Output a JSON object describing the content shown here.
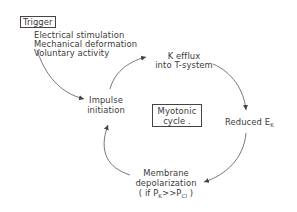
{
  "diagram": {
    "trigger": {
      "title": "Trigger",
      "causes": [
        "Electrical stimulation",
        "Mechanical deformation",
        "Voluntary activity"
      ]
    },
    "cycle_center": {
      "line1": "Myotonic",
      "line2": "cycle ."
    },
    "nodes": {
      "k_efflux": {
        "line1": "K efflux",
        "line2": "into T-system"
      },
      "reduced_ek": {
        "text": "Reduced E",
        "subscript": "K"
      },
      "membrane_depol": {
        "line1": "Membrane",
        "line2": "depolarization",
        "line3_prefix": "( if P",
        "line3_sub1": "K",
        "line3_mid": ">>P",
        "line3_sub2": "Cl",
        "line3_suffix": " )"
      },
      "impulse": {
        "line1": "Impulse",
        "line2": "initiation"
      }
    },
    "colors": {
      "line": "#555555",
      "text": "#3a3a3a"
    }
  }
}
